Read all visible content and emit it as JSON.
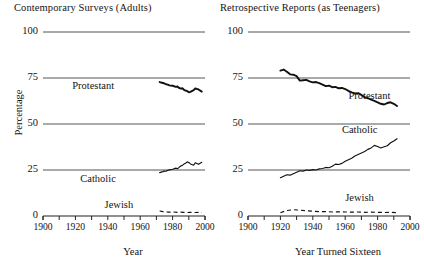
{
  "figure": {
    "ylabel": "Percentage"
  },
  "chart_data": [
    {
      "type": "line",
      "title": "Contemporary Surveys (Adults)",
      "xlabel": "Year",
      "ylabel": "Percentage",
      "xlim": [
        1900,
        2000
      ],
      "ylim": [
        0,
        100
      ],
      "grid": true,
      "legend_position": "inline-labels",
      "yticks": [
        0,
        25,
        50,
        75,
        100
      ],
      "xticks": [
        1900,
        1910,
        1920,
        1930,
        1940,
        1950,
        1960,
        1970,
        1980,
        1990,
        2000
      ],
      "xticklabels": [
        "1900",
        "1920",
        "1940",
        "1960",
        "1980",
        "2000"
      ],
      "xticklabel_values": [
        1900,
        1920,
        1940,
        1960,
        1980,
        2000
      ],
      "series": [
        {
          "name": "Protestant",
          "style": "solid-thick",
          "x": [
            1972,
            1974,
            1975,
            1976,
            1977,
            1978,
            1980,
            1982,
            1983,
            1984,
            1985,
            1986,
            1987,
            1988,
            1989,
            1990,
            1991,
            1993,
            1994,
            1996,
            1998
          ],
          "values": [
            72.8,
            72.3,
            72.0,
            71.6,
            71.4,
            71.0,
            70.8,
            70.2,
            70.4,
            69.6,
            69.2,
            69.4,
            68.6,
            68.2,
            67.9,
            67.2,
            67.5,
            68.4,
            69.3,
            68.8,
            67.6
          ]
        },
        {
          "name": "Catholic",
          "style": "solid",
          "x": [
            1972,
            1974,
            1975,
            1976,
            1977,
            1978,
            1980,
            1982,
            1983,
            1984,
            1985,
            1986,
            1987,
            1988,
            1989,
            1990,
            1991,
            1993,
            1994,
            1996,
            1998
          ],
          "values": [
            23.6,
            24.1,
            24.4,
            24.3,
            24.8,
            25.1,
            25.4,
            26.0,
            25.7,
            26.4,
            27.2,
            27.5,
            28.2,
            28.7,
            29.4,
            29.1,
            28.3,
            27.6,
            28.9,
            28.1,
            29.2
          ]
        },
        {
          "name": "Jewish",
          "style": "dashed",
          "x": [
            1972,
            1974,
            1976,
            1978,
            1980,
            1983,
            1985,
            1987,
            1989,
            1991,
            1994,
            1996,
            1998
          ],
          "values": [
            2.7,
            2.4,
            2.2,
            2.1,
            2.2,
            2.0,
            2.1,
            2.0,
            1.9,
            2.0,
            1.9,
            2.0,
            1.9
          ]
        }
      ]
    },
    {
      "type": "line",
      "title": "Retrospective Reports (as Teenagers)",
      "xlabel": "Year Turned Sixteen",
      "ylabel": "Percentage",
      "xlim": [
        1900,
        2000
      ],
      "ylim": [
        0,
        100
      ],
      "grid": true,
      "legend_position": "inline-labels",
      "yticks": [
        0,
        25,
        50,
        75,
        100
      ],
      "xticks": [
        1900,
        1910,
        1920,
        1930,
        1940,
        1950,
        1960,
        1970,
        1980,
        1990,
        2000
      ],
      "xticklabels": [
        "1900",
        "1920",
        "1940",
        "1960",
        "1980",
        "2000"
      ],
      "xticklabel_values": [
        1900,
        1920,
        1940,
        1960,
        1980,
        2000
      ],
      "series": [
        {
          "name": "Protestant",
          "style": "solid-thick",
          "x": [
            1920,
            1922,
            1924,
            1926,
            1928,
            1930,
            1932,
            1934,
            1936,
            1938,
            1940,
            1942,
            1944,
            1946,
            1948,
            1950,
            1952,
            1954,
            1956,
            1958,
            1960,
            1962,
            1964,
            1966,
            1968,
            1970,
            1972,
            1974,
            1976,
            1978,
            1980,
            1982,
            1984,
            1986,
            1988,
            1990,
            1992
          ],
          "values": [
            79.0,
            79.6,
            78.4,
            77.0,
            76.8,
            76.0,
            73.6,
            73.8,
            74.0,
            73.2,
            72.6,
            72.8,
            72.2,
            71.4,
            70.6,
            70.8,
            70.0,
            70.2,
            69.4,
            69.6,
            69.0,
            68.0,
            67.2,
            66.6,
            66.8,
            65.8,
            64.6,
            64.0,
            63.2,
            62.6,
            61.8,
            61.0,
            60.6,
            61.4,
            61.8,
            61.0,
            59.8
          ]
        },
        {
          "name": "Catholic",
          "style": "solid",
          "x": [
            1920,
            1922,
            1924,
            1926,
            1928,
            1930,
            1932,
            1934,
            1936,
            1938,
            1940,
            1942,
            1944,
            1946,
            1948,
            1950,
            1952,
            1954,
            1956,
            1958,
            1960,
            1962,
            1964,
            1966,
            1968,
            1970,
            1972,
            1974,
            1976,
            1978,
            1980,
            1982,
            1984,
            1986,
            1988,
            1990,
            1992
          ],
          "values": [
            20.8,
            21.6,
            22.4,
            22.2,
            23.0,
            23.8,
            24.6,
            24.4,
            25.0,
            24.8,
            25.2,
            25.0,
            25.6,
            25.8,
            26.4,
            26.2,
            27.0,
            28.2,
            28.0,
            28.6,
            29.8,
            30.6,
            31.4,
            32.6,
            33.4,
            34.2,
            35.0,
            36.2,
            37.0,
            38.4,
            37.8,
            37.0,
            37.6,
            38.2,
            39.8,
            40.8,
            42.0
          ]
        },
        {
          "name": "Jewish",
          "style": "dashed",
          "x": [
            1920,
            1924,
            1928,
            1932,
            1936,
            1940,
            1944,
            1948,
            1952,
            1956,
            1960,
            1964,
            1968,
            1972,
            1976,
            1980,
            1984,
            1988,
            1992
          ],
          "values": [
            1.8,
            3.0,
            3.4,
            3.2,
            2.8,
            2.6,
            2.4,
            2.4,
            2.2,
            2.3,
            2.2,
            2.1,
            2.2,
            2.0,
            2.1,
            2.0,
            1.9,
            2.0,
            1.8
          ]
        }
      ]
    }
  ]
}
